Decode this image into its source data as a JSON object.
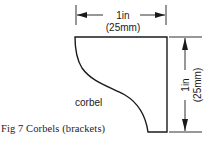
{
  "figure": {
    "caption": "Fig 7 Corbels (brackets)",
    "part_label": "corbel",
    "width_dimension": {
      "imperial": "1in",
      "metric": "(25mm)"
    },
    "height_dimension": {
      "imperial": "1in",
      "metric": "(25mm)"
    },
    "colors": {
      "line": "#1a1a1a",
      "background": "#ffffff"
    }
  }
}
